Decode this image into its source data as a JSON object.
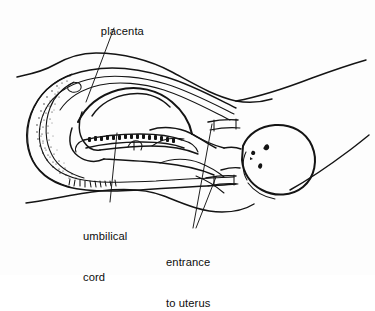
{
  "figure": {
    "kind": "medical-line-illustration",
    "background_color": "#fdfdfd",
    "ink_color": "#141414",
    "width": 375,
    "height": 275
  },
  "labels": {
    "placenta": {
      "name": "placenta",
      "text": "placenta",
      "lines": [
        "placenta"
      ]
    },
    "umbilical_cord": {
      "name": "umbilical-cord",
      "text": "umbilical cord",
      "lines": [
        "umbilical",
        "cord"
      ],
      "line1": "umbilical",
      "line2": "cord"
    },
    "entrance_to_uterus": {
      "name": "entrance-to-uterus",
      "text": "entrance to uterus",
      "lines": [
        "entrance",
        "to uterus"
      ],
      "line1": "entrance",
      "line2": "to uterus"
    }
  },
  "anatomy_parts": [
    "maternal-abdomen-outline",
    "uterus-wall",
    "placenta-stippled-band",
    "amniotic-sac",
    "fetus-body",
    "fetus-head",
    "fetus-face",
    "fetus-limbs",
    "umbilical-cord",
    "cervix-entrance-upper",
    "cervix-entrance-lower"
  ],
  "leader_lines": [
    {
      "name": "leader-placenta",
      "from_label": "placenta",
      "to_part": "placenta-stippled-band"
    },
    {
      "name": "leader-umbilical-cord",
      "from_label": "umbilical cord",
      "to_part": "umbilical-cord"
    },
    {
      "name": "leader-entrance-upper",
      "from_label": "entrance to uterus",
      "to_part": "cervix-entrance-upper"
    },
    {
      "name": "leader-entrance-lower",
      "from_label": "entrance to uterus",
      "to_part": "cervix-entrance-lower"
    }
  ]
}
